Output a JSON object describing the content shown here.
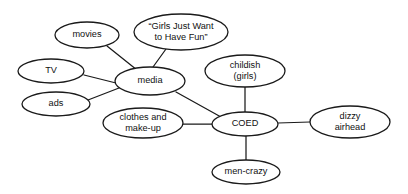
{
  "diagram": {
    "type": "concept-map",
    "title": "",
    "central_node": "COED",
    "secondary_hub": "media",
    "nodes": [
      {
        "id": "movies",
        "label": "movies",
        "lines": [
          "movies"
        ],
        "cx": 87,
        "cy": 35,
        "rx": 32,
        "ry": 13
      },
      {
        "id": "quote",
        "label": "“Girls Just Want to Have Fun”",
        "lines": [
          "“Girls Just Want",
          "to Have Fun”"
        ],
        "cx": 181,
        "cy": 32,
        "rx": 47,
        "ry": 18
      },
      {
        "id": "tv",
        "label": "TV",
        "lines": [
          "TV"
        ],
        "cx": 51,
        "cy": 71,
        "rx": 33,
        "ry": 12
      },
      {
        "id": "media",
        "label": "media",
        "lines": [
          "media"
        ],
        "cx": 150,
        "cy": 81,
        "rx": 35,
        "ry": 14
      },
      {
        "id": "ads",
        "label": "ads",
        "lines": [
          "ads"
        ],
        "cx": 56,
        "cy": 104,
        "rx": 34,
        "ry": 12
      },
      {
        "id": "childish",
        "label": "childish (girls)",
        "lines": [
          "childish",
          "(girls)"
        ],
        "cx": 245,
        "cy": 71,
        "rx": 40,
        "ry": 16
      },
      {
        "id": "clothes",
        "label": "clothes and make-up",
        "lines": [
          "clothes and",
          "make-up"
        ],
        "cx": 143,
        "cy": 123,
        "rx": 40,
        "ry": 15
      },
      {
        "id": "coed",
        "label": "COED",
        "lines": [
          "COED"
        ],
        "cx": 245,
        "cy": 124,
        "rx": 33,
        "ry": 12
      },
      {
        "id": "dizzy",
        "label": "dizzy airhead",
        "lines": [
          "dizzy",
          "airhead"
        ],
        "cx": 350,
        "cy": 122,
        "rx": 40,
        "ry": 16
      },
      {
        "id": "mencrazy",
        "label": "men-crazy",
        "lines": [
          "men-crazy"
        ],
        "cx": 246,
        "cy": 172,
        "rx": 34,
        "ry": 12
      }
    ],
    "edges": [
      {
        "from": "movies",
        "to": "media",
        "x1": 107,
        "y1": 46,
        "x2": 137,
        "y2": 70
      },
      {
        "from": "quote",
        "to": "media",
        "x1": 166,
        "y1": 49,
        "x2": 153,
        "y2": 67
      },
      {
        "from": "tv",
        "to": "media",
        "x1": 84,
        "y1": 75,
        "x2": 116,
        "y2": 83
      },
      {
        "from": "ads",
        "to": "media",
        "x1": 88,
        "y1": 100,
        "x2": 119,
        "y2": 88
      },
      {
        "from": "media",
        "to": "coed",
        "x1": 176,
        "y1": 92,
        "x2": 221,
        "y2": 117
      },
      {
        "from": "clothes",
        "to": "coed",
        "x1": 183,
        "y1": 124,
        "x2": 212,
        "y2": 124
      },
      {
        "from": "childish",
        "to": "coed",
        "x1": 245,
        "y1": 87,
        "x2": 245,
        "y2": 112
      },
      {
        "from": "coed",
        "to": "dizzy",
        "x1": 278,
        "y1": 123,
        "x2": 310,
        "y2": 122
      },
      {
        "from": "coed",
        "to": "mencrazy",
        "x1": 246,
        "y1": 136,
        "x2": 246,
        "y2": 160
      }
    ],
    "colors": {
      "stroke": "#1a1a1a",
      "fill": "#ffffff",
      "text": "#111111",
      "background": "#ffffff"
    }
  }
}
